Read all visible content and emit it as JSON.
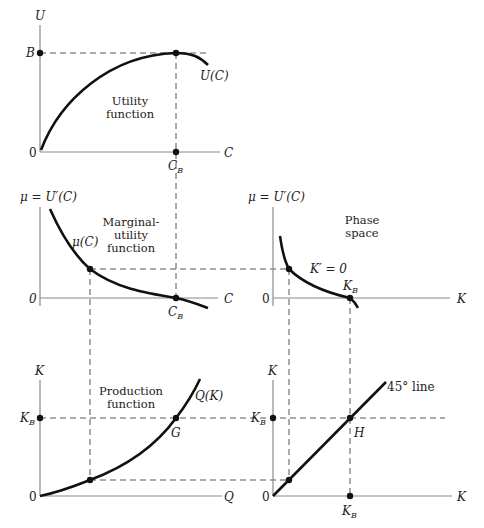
{
  "diagram": {
    "panels": {
      "utility": {
        "title_lines": [
          "Utility",
          "function"
        ],
        "y_axis_label": "U",
        "x_axis_label": "C",
        "origin_label": "0",
        "y_tick_label": "B",
        "x_tick_label": "C",
        "x_tick_sub": "B",
        "curve_label": "U(C)"
      },
      "marginal_utility": {
        "title_lines": [
          "Marginal-",
          "utility",
          "function"
        ],
        "y_axis_label": "μ = U′(C)",
        "x_axis_label": "C",
        "origin_label": "0",
        "x_tick_label": "C",
        "x_tick_sub": "B",
        "curve_label": "μ(C)"
      },
      "phase_space": {
        "title_lines": [
          "Phase",
          "space"
        ],
        "y_axis_label": "μ = U′(C)",
        "x_axis_label": "K",
        "origin_label": "0",
        "point_label": "K",
        "point_sub": "B",
        "curve_label": "K′ = 0"
      },
      "production": {
        "title_lines": [
          "Production",
          "function"
        ],
        "y_axis_label": "K",
        "x_axis_label": "Q",
        "origin_label": "0",
        "y_tick_label": "K",
        "y_tick_sub": "B",
        "curve_label": "Q(K)",
        "point_label": "G"
      },
      "forty_five": {
        "y_axis_label": "K",
        "x_axis_label": "K",
        "origin_label": "0",
        "y_tick_label": "K",
        "y_tick_sub": "B",
        "x_tick_label": "K",
        "x_tick_sub": "B",
        "line_label": "45° line",
        "point_label": "H"
      }
    }
  }
}
